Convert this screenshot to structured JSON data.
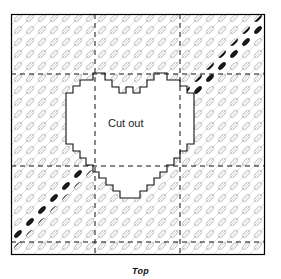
{
  "figure": {
    "caption": "Top",
    "cut_out_label": "Cut out",
    "panel": {
      "x": 11,
      "y": 14,
      "width": 254,
      "height": 241,
      "border_color": "#000000",
      "border_width": 1,
      "background_color": "#ffffff"
    },
    "grid": {
      "style": "dashed",
      "color": "#111111",
      "rows": 3,
      "cols": 3,
      "vertical_lines_x": [
        95,
        180
      ],
      "horizontal_lines_y": [
        74,
        166,
        242
      ],
      "dash_pattern": "5 4"
    },
    "hatch": {
      "pattern_name": "oval-slash-hatch",
      "light_color": "#b9b9b9",
      "dark_color": "#1a1a1a",
      "cell_size": 12,
      "oval_angle_deg": -45,
      "description": "Repeating diagonal elongated oval outlines"
    },
    "dark_bands": [
      {
        "name": "upper-right-band",
        "x1": 196,
        "y1": 85,
        "x2": 258,
        "y2": 23,
        "thickness": 26,
        "angle_deg": -45,
        "color": "#1a1a1a"
      },
      {
        "name": "lower-left-band",
        "x1": 20,
        "y1": 238,
        "x2": 100,
        "y2": 158,
        "thickness": 26,
        "angle_deg": -45,
        "color": "#1a1a1a"
      }
    ],
    "heart": {
      "name": "heart-cut-out",
      "fill": "#ffffff",
      "stroke": "#111111",
      "stroke_width": 1,
      "style": "stepped-pixelated",
      "label_x": 133,
      "label_y": 124,
      "points": "66,144 66,93 73,93 73,86 80,86 80,80 93,80 93,73 105,73 105,80 112,80 112,87 119,87 119,93 126,93 126,87 133,87 133,93 140,93 140,87 147,87 147,80 154,80 154,73 167,73 167,80 180,80 180,86 187,86 187,93 194,93 194,144 187,144 187,151 180,151 180,158 174,158 174,165 167,165 167,172 160,172 160,178 154,178 154,185 147,185 147,191 140,191 140,198 120,198 120,191 113,191 113,185 106,185 106,178 99,178 99,172 93,172 93,165 86,165 86,158 80,158 80,151 73,151 73,144"
    }
  }
}
